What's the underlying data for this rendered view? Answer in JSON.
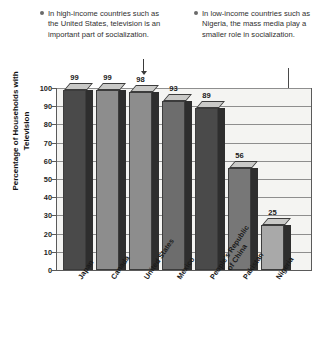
{
  "annotations": [
    {
      "id": "high-income-note",
      "bullet": "bullet-icon",
      "text": "In high-income countries such as the United States, television is an important part of socialization."
    },
    {
      "id": "low-income-note",
      "bullet": "bullet-icon",
      "text": "In low-income countries such as Nigeria, the mass media play a smaller role in socialization."
    }
  ],
  "chart_data": {
    "type": "bar",
    "title": "",
    "xlabel": "",
    "ylabel": "Percentage of Households with Television",
    "ylim": [
      0,
      100
    ],
    "yticks": [
      100,
      90,
      80,
      70,
      60,
      50,
      40,
      30,
      20,
      10,
      0
    ],
    "grid": true,
    "legend": "none",
    "categories": [
      "Japan",
      "Canada",
      "United States",
      "Mexico",
      "People's Republic of China",
      "Pakistan",
      "Nigeria"
    ],
    "category_lines": [
      [
        "Japan"
      ],
      [
        "Canada"
      ],
      [
        "United States"
      ],
      [
        "Mexico"
      ],
      [
        "People's Republic",
        "of China"
      ],
      [
        "Pakistan"
      ],
      [
        "Nigeria"
      ]
    ],
    "values": [
      99,
      99,
      98,
      93,
      89,
      56,
      25
    ],
    "value_labels": [
      "99",
      "99",
      "98",
      "93",
      "89",
      "56",
      "25"
    ],
    "bar_colors": [
      "#4a4a4a",
      "#8d8d8d",
      "#8d8d8d",
      "#6d6d6d",
      "#4a4a4a",
      "#777777",
      "#a9a9a9"
    ],
    "annotation_targets": [
      "United States",
      "Nigeria"
    ]
  },
  "colors": {
    "plot_background": "#f4f4f2",
    "axis": "#5a5a5a",
    "gridline": "#8e8e8e",
    "text": "#1b1b1b",
    "bar_top": "#c9c9c7",
    "bar_side": "#2e2e2e"
  }
}
